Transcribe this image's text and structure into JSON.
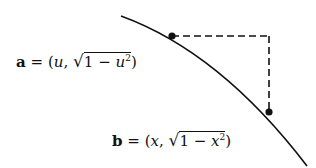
{
  "diagram": {
    "type": "geometric-diagram",
    "curve": {
      "path": "M121,16 Q220,55 307,166",
      "color": "#111111"
    },
    "points": [
      {
        "id": "a",
        "x": 172,
        "y": 36
      },
      {
        "id": "b",
        "x": 270,
        "y": 112
      }
    ],
    "dashed_corner": {
      "x": 269,
      "y": 36
    },
    "labels": {
      "a": {
        "var": "a",
        "eq": "=",
        "open": "(",
        "coord1": "u",
        "comma": ",",
        "radical": "√",
        "one": "1",
        "minus": "−",
        "coord2": "u",
        "exp": "2",
        "close": ")"
      },
      "b": {
        "var": "b",
        "eq": "=",
        "open": "(",
        "coord1": "x",
        "comma": ",",
        "radical": "√",
        "one": "1",
        "minus": "−",
        "coord2": "x",
        "exp": "2",
        "close": ")"
      }
    }
  }
}
